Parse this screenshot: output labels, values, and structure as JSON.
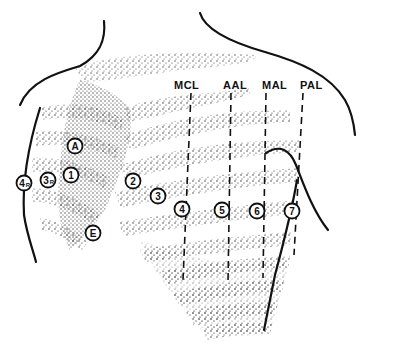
{
  "figure": {
    "type": "anatomical-diagram",
    "background": "#ffffff",
    "ink": "#111111"
  },
  "reference_lines": [
    {
      "id": "mcl",
      "label": "MCL",
      "label_x": 174,
      "label_y": 89,
      "x_top": 191,
      "y_top": 93,
      "x_bot": 183,
      "y_bot": 280
    },
    {
      "id": "aal",
      "label": "AAL",
      "label_x": 223,
      "label_y": 89,
      "x_top": 231,
      "y_top": 93,
      "x_bot": 228,
      "y_bot": 282
    },
    {
      "id": "mal",
      "label": "MAL",
      "label_x": 262,
      "label_y": 89,
      "x_top": 266,
      "y_top": 93,
      "x_bot": 263,
      "y_bot": 278
    },
    {
      "id": "pal",
      "label": "PAL",
      "label_x": 300,
      "label_y": 89,
      "x_top": 303,
      "y_top": 93,
      "x_bot": 294,
      "y_bot": 255
    }
  ],
  "electrodes": [
    {
      "id": "A",
      "label": "A",
      "sub": "",
      "x": 75,
      "y": 146
    },
    {
      "id": "1",
      "label": "1",
      "sub": "",
      "x": 71,
      "y": 175
    },
    {
      "id": "3R",
      "label": "3",
      "sub": "R",
      "x": 48,
      "y": 180
    },
    {
      "id": "4R",
      "label": "4",
      "sub": "R",
      "x": 24,
      "y": 183
    },
    {
      "id": "2",
      "label": "2",
      "sub": "",
      "x": 133,
      "y": 181
    },
    {
      "id": "3",
      "label": "3",
      "sub": "",
      "x": 158,
      "y": 196
    },
    {
      "id": "4",
      "label": "4",
      "sub": "",
      "x": 182,
      "y": 209
    },
    {
      "id": "5",
      "label": "5",
      "sub": "",
      "x": 222,
      "y": 210
    },
    {
      "id": "6",
      "label": "6",
      "sub": "",
      "x": 257,
      "y": 211
    },
    {
      "id": "7",
      "label": "7",
      "sub": "",
      "x": 292,
      "y": 211
    },
    {
      "id": "E",
      "label": "E",
      "sub": "",
      "x": 93,
      "y": 233
    }
  ]
}
